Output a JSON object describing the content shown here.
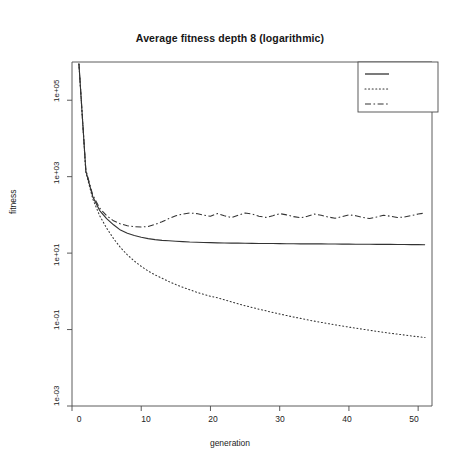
{
  "chart_data": {
    "type": "line",
    "title": "Average fitness depth 8 (logarithmic)",
    "xlabel": "generation",
    "ylabel": "fitness",
    "yscale": "log",
    "xlim": [
      0,
      52
    ],
    "ylim": [
      0.001,
      1000000
    ],
    "grid": false,
    "legend_position": "top-right",
    "xticks": [
      0,
      10,
      20,
      30,
      40,
      50
    ],
    "xtick_labels": [
      "0",
      "10",
      "20",
      "30",
      "40",
      "50"
    ],
    "yticks": [
      100000,
      1000,
      10,
      0.1,
      0.001
    ],
    "ytick_labels": [
      "1e+05",
      "1e+03",
      "1e+01",
      "1e-01",
      "1e-03"
    ],
    "x": [
      1,
      2,
      3,
      4,
      5,
      6,
      7,
      8,
      9,
      10,
      11,
      12,
      13,
      14,
      15,
      16,
      17,
      18,
      19,
      20,
      21,
      22,
      23,
      24,
      25,
      26,
      27,
      28,
      29,
      30,
      31,
      32,
      33,
      34,
      35,
      36,
      37,
      38,
      39,
      40,
      41,
      42,
      43,
      44,
      45,
      46,
      47,
      48,
      49,
      50,
      51
    ],
    "series": [
      {
        "name": "standard",
        "style": "solid",
        "color": "#333333",
        "values": [
          900000,
          1400,
          300,
          130,
          80,
          55,
          40,
          33,
          29,
          26,
          24,
          22.5,
          21.5,
          21,
          20.5,
          20,
          19.5,
          19.2,
          19,
          18.8,
          18.6,
          18.4,
          18.3,
          18.2,
          18.1,
          18,
          17.9,
          17.8,
          17.8,
          17.7,
          17.6,
          17.6,
          17.5,
          17.5,
          17.4,
          17.4,
          17.3,
          17.3,
          17.2,
          17.2,
          17.1,
          17.1,
          17.0,
          17.0,
          16.9,
          16.9,
          16.8,
          16.8,
          16.7,
          16.7,
          16.6
        ]
      },
      {
        "name": "nodal",
        "style": "dotted",
        "color": "#333333",
        "values": [
          900000,
          1300,
          260,
          95,
          45,
          24,
          14,
          9,
          6.2,
          4.5,
          3.4,
          2.7,
          2.2,
          1.8,
          1.5,
          1.28,
          1.1,
          0.95,
          0.84,
          0.74,
          0.68,
          0.6,
          0.53,
          0.47,
          0.42,
          0.38,
          0.34,
          0.31,
          0.28,
          0.255,
          0.233,
          0.213,
          0.196,
          0.18,
          0.166,
          0.154,
          0.143,
          0.133,
          0.124,
          0.116,
          0.109,
          0.102,
          0.096,
          0.09,
          0.085,
          0.08,
          0.076,
          0.072,
          0.068,
          0.065,
          0.062
        ]
      },
      {
        "name": "structural",
        "style": "dashdot",
        "color": "#333333",
        "values": [
          900000,
          1500,
          330,
          150,
          95,
          70,
          58,
          52,
          49,
          48,
          50,
          56,
          66,
          80,
          95,
          105,
          112,
          108,
          98,
          92,
          108,
          95,
          85,
          98,
          112,
          105,
          92,
          86,
          95,
          108,
          100,
          90,
          84,
          92,
          105,
          98,
          88,
          82,
          90,
          100,
          95,
          86,
          80,
          88,
          98,
          92,
          85,
          88,
          96,
          105,
          112
        ]
      }
    ]
  },
  "legend": {
    "entries": [
      {
        "label": "standard",
        "style": "solid"
      },
      {
        "label": "nodal",
        "style": "dotted"
      },
      {
        "label": "structural",
        "style": "dashdot"
      }
    ]
  }
}
